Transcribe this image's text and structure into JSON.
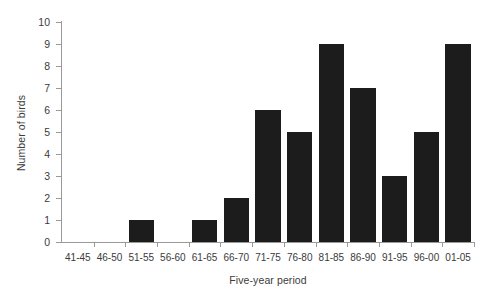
{
  "chart_data": {
    "type": "bar",
    "title": "",
    "xlabel": "Five-year period",
    "ylabel": "Number of birds",
    "categories": [
      "41-45",
      "46-50",
      "51-55",
      "56-60",
      "61-65",
      "66-70",
      "71-75",
      "76-80",
      "81-85",
      "86-90",
      "91-95",
      "96-00",
      "01-05"
    ],
    "values": [
      0,
      0,
      1,
      0,
      1,
      2,
      6,
      5,
      9,
      7,
      3,
      5,
      9
    ],
    "ylim": [
      0,
      10
    ],
    "ytick_step": 1,
    "yticks": [
      "10",
      "9",
      "8",
      "7",
      "6",
      "5",
      "4",
      "3",
      "2",
      "1",
      "0"
    ],
    "grid": false,
    "legend": false,
    "legend_position": "none",
    "bar_color": "#1c1c1c",
    "axis_color": "#9a9a9a",
    "text_color": "#3b3b3b",
    "background_color": "#ffffff"
  }
}
